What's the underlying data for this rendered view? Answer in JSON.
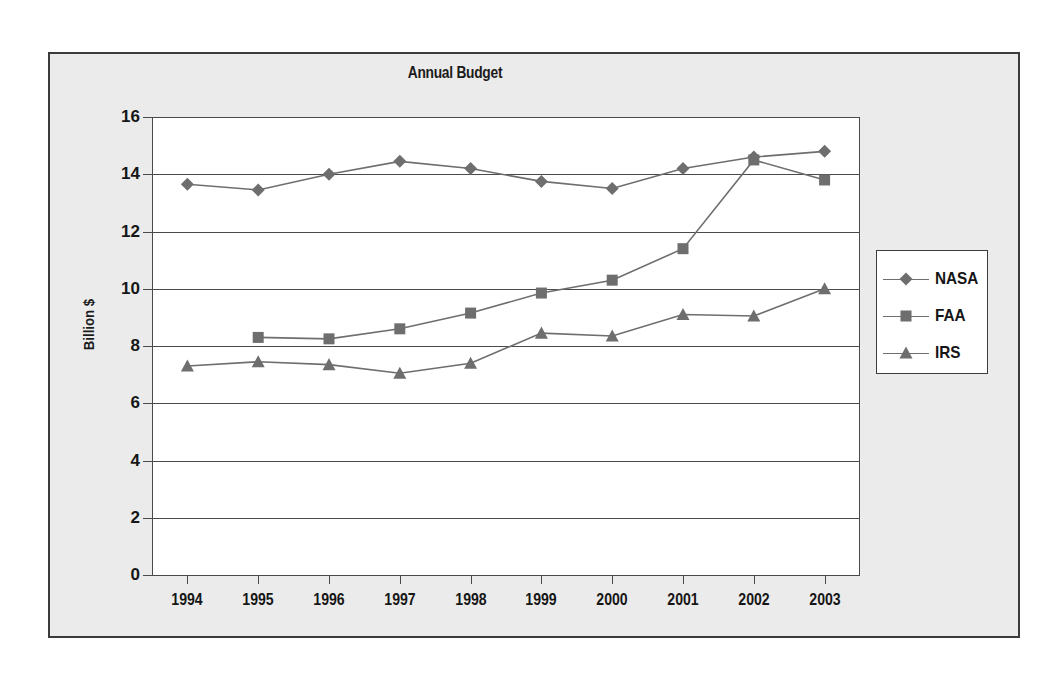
{
  "chart_data": {
    "type": "line",
    "title": "Annual Budget",
    "xlabel": "",
    "ylabel": "Billion $",
    "categories": [
      "1994",
      "1995",
      "1996",
      "1997",
      "1998",
      "1999",
      "2000",
      "2001",
      "2002",
      "2003"
    ],
    "ylim": [
      0,
      16
    ],
    "yticks": [
      "0",
      "2",
      "4",
      "6",
      "8",
      "10",
      "12",
      "14",
      "16"
    ],
    "ytick_values": [
      0,
      2,
      4,
      6,
      8,
      10,
      12,
      14,
      16
    ],
    "grid": "horizontal",
    "legend_position": "right",
    "series": [
      {
        "name": "NASA",
        "marker": "diamond",
        "values": [
          13.65,
          13.45,
          14.0,
          14.45,
          14.2,
          13.75,
          13.5,
          14.2,
          14.6,
          14.8
        ]
      },
      {
        "name": "FAA",
        "marker": "square",
        "values": [
          null,
          8.3,
          8.25,
          8.6,
          9.15,
          9.85,
          10.3,
          11.4,
          14.5,
          13.8
        ]
      },
      {
        "name": "IRS",
        "marker": "triangle",
        "values": [
          7.3,
          7.45,
          7.35,
          7.05,
          7.4,
          8.45,
          8.35,
          9.1,
          9.05,
          10.0
        ]
      }
    ],
    "series_color": "#6e6e6e",
    "axis_color": "#4a4a4a",
    "text_color": "#161616",
    "plot_background": "#ffffff",
    "figure_background": "#ebebeb"
  },
  "legend": {
    "entries": [
      {
        "label": "NASA",
        "marker": "diamond"
      },
      {
        "label": "FAA",
        "marker": "square"
      },
      {
        "label": "IRS",
        "marker": "triangle"
      }
    ]
  }
}
